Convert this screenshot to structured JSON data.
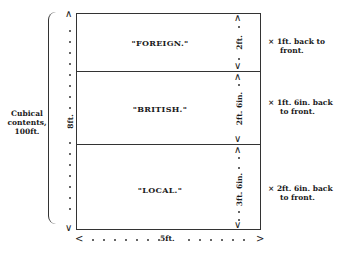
{
  "diagram": {
    "title": "",
    "compartments": [
      {
        "label": "\"FOREIGN.\"",
        "height": "2ft.",
        "depth_note_line1": "× 1ft. back to",
        "depth_note_line2": "front."
      },
      {
        "label": "\"BRITISH.\"",
        "height": "2ft. 6in.",
        "depth_note_line1": "× 1ft. 6in. back",
        "depth_note_line2": "to front."
      },
      {
        "label": "\"LOCAL.\"",
        "height": "3ft. 6in.",
        "depth_note_line1": "× 2ft. 6in. back",
        "depth_note_line2": "to front."
      }
    ],
    "total_height": "8ft.",
    "width": "5ft.",
    "cubical_contents": {
      "line1": "Cubical",
      "line2": "contents,",
      "line3": "100ft."
    },
    "arrows": {
      "up": "^",
      "down": "v",
      "left": "<",
      "right": ">"
    }
  }
}
